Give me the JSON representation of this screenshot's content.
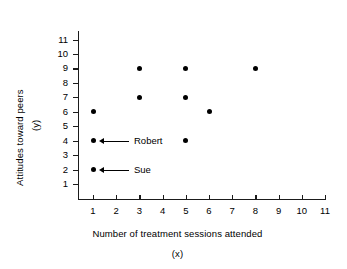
{
  "chart_data": {
    "type": "scatter",
    "title": "",
    "xlabel": "Number of treatment sessions attended",
    "xlabel_symbol": "(x)",
    "ylabel": "Attitudes toward peers",
    "ylabel_symbol": "(y)",
    "xlim": [
      0,
      11
    ],
    "ylim": [
      0,
      11.6
    ],
    "xticks": [
      1,
      2,
      3,
      4,
      5,
      6,
      7,
      8,
      9,
      10,
      11
    ],
    "yticks": [
      1,
      2,
      3,
      4,
      5,
      6,
      7,
      8,
      9,
      10,
      11
    ],
    "grid": false,
    "legend": null,
    "marker_color": "#000000",
    "axis_color": "#1b1b1b",
    "points": [
      {
        "x": 1,
        "y": 6
      },
      {
        "x": 1,
        "y": 4
      },
      {
        "x": 1,
        "y": 2
      },
      {
        "x": 3,
        "y": 9
      },
      {
        "x": 3,
        "y": 7
      },
      {
        "x": 5,
        "y": 9
      },
      {
        "x": 5,
        "y": 7
      },
      {
        "x": 5,
        "y": 4
      },
      {
        "x": 6,
        "y": 6
      },
      {
        "x": 8,
        "y": 9
      }
    ],
    "annotations": [
      {
        "label": "Robert",
        "x": 1,
        "y": 4
      },
      {
        "label": "Sue",
        "x": 1,
        "y": 2
      }
    ]
  }
}
